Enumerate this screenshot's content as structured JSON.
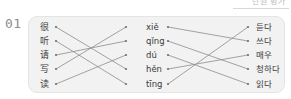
{
  "header": {
    "cut_off_text": "단원 평가"
  },
  "question": {
    "number": "01"
  },
  "exercise": {
    "type": "matching",
    "columns": {
      "hanzi": {
        "label": "Chinese characters",
        "items": [
          "很",
          "听",
          "请",
          "写",
          "读"
        ]
      },
      "pinyin": {
        "label": "Pinyin",
        "items": [
          "xiě",
          "qǐng",
          "dú",
          "hěn",
          "tīng"
        ]
      },
      "korean": {
        "label": "Korean meanings",
        "items": [
          "듣다",
          "쓰다",
          "매우",
          "청하다",
          "읽다"
        ]
      }
    },
    "connections_hanzi_to_pinyin": [
      {
        "from": 0,
        "to": 3
      },
      {
        "from": 1,
        "to": 4
      },
      {
        "from": 2,
        "to": 1
      },
      {
        "from": 3,
        "to": 0
      },
      {
        "from": 4,
        "to": 2
      }
    ],
    "connections_pinyin_to_korean": [
      {
        "from": 0,
        "to": 1
      },
      {
        "from": 1,
        "to": 3
      },
      {
        "from": 2,
        "to": 4
      },
      {
        "from": 3,
        "to": 2
      },
      {
        "from": 4,
        "to": 0
      }
    ]
  },
  "colors": {
    "panel_background": "#f2f2f2",
    "panel_border": "#e4e4e4",
    "line": "#8d8d8d",
    "dot": "#6f6f6f",
    "text": "#3a3a3a",
    "question_number": "#8e8e8e",
    "page_background": "#ffffff"
  },
  "geometry": {
    "row_y": [
      11,
      25,
      39,
      53,
      68
    ],
    "hanzi_dot_x": 28,
    "pinyin_dot_left_x": 98,
    "pinyin_dot_right_x": 140,
    "korean_dot_x": 220
  }
}
